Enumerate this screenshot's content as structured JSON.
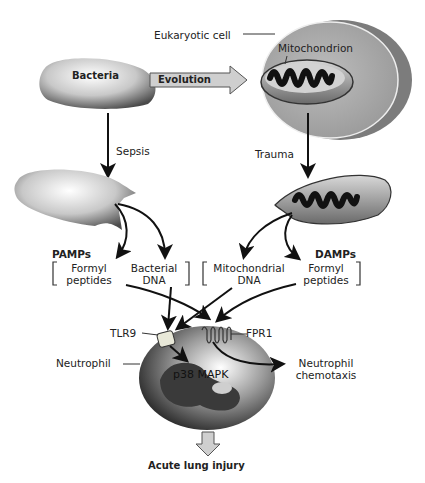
{
  "diagram": {
    "nodes": {
      "bacteria": "Bacteria",
      "eukaryotic_cell": "Eukaryotic cell",
      "mitochondrion": "Mitochondrion",
      "neutrophil": "Neutrophil",
      "tlr9": "TLR9",
      "fpr1": "FPR1",
      "p38": "p38 MAPK"
    },
    "edges": {
      "evolution": "Evolution",
      "sepsis": "Sepsis",
      "trauma": "Trauma"
    },
    "groups": {
      "pamps": {
        "title": "PAMPs",
        "items": [
          "Formyl peptides",
          "Bacterial DNA"
        ],
        "item0_l1": "Formyl",
        "item0_l2": "peptides",
        "item1_l1": "Bacterial",
        "item1_l2": "DNA"
      },
      "damps": {
        "title": "DAMPs",
        "items": [
          "Mitochondrial DNA",
          "Formyl peptides"
        ],
        "item0_l1": "Mitochondrial",
        "item0_l2": "DNA",
        "item1_l1": "Formyl",
        "item1_l2": "peptides"
      }
    },
    "outcomes": {
      "chemotaxis_l1": "Neutrophil",
      "chemotaxis_l2": "chemotaxis",
      "injury": "Acute lung injury"
    }
  }
}
